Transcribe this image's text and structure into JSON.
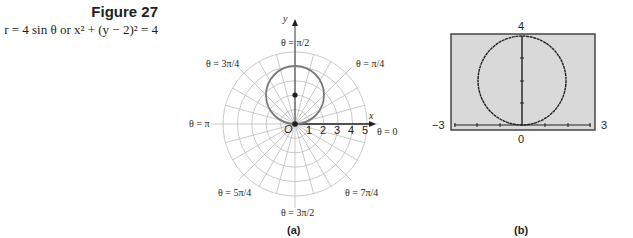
{
  "figure": {
    "title": "Figure 27",
    "equation_polar": "r = 4 sin θ",
    "equation_joiner": "or",
    "equation_rect": "x² + (y − 2)² = 4"
  },
  "panel_a": {
    "sublabel": "(a)",
    "axis_x_label": "x",
    "axis_y_label": "y",
    "pole_label": "O",
    "radial_ticks": [
      "1",
      "2",
      "3",
      "4",
      "5"
    ],
    "angle_labels": {
      "theta_0": "θ = 0",
      "theta_pi_4": "θ = π/4",
      "theta_pi_2": "θ = π/2",
      "theta_3pi_4": "θ = 3π/4",
      "theta_pi": "θ = π",
      "theta_5pi_4": "θ = 5π/4",
      "theta_3pi_2": "θ = 3π/2",
      "theta_7pi_4": "θ = 7π/4"
    }
  },
  "panel_b": {
    "sublabel": "(b)",
    "x_min_label": "−3",
    "x_max_label": "3",
    "y_max_label": "4",
    "y_min_label": "0",
    "screen_bg": "#d9d9d9"
  },
  "chart_data": [
    {
      "type": "scatter",
      "title": "(a) r = 4 sin θ on polar grid",
      "coordinate_system": "polar",
      "grid_circles": [
        1,
        2,
        3,
        4,
        5
      ],
      "ray_spacing_radians": "π/12",
      "series": [
        {
          "name": "r = 4 sin θ",
          "shape": "circle",
          "center": [
            0,
            2
          ],
          "radius": 2
        }
      ],
      "points": [
        {
          "label": "center",
          "x": 0,
          "y": 2
        },
        {
          "label": "O",
          "x": 0,
          "y": 0
        }
      ],
      "xlabel": "x",
      "ylabel": "y",
      "angle_labels": [
        "θ = 0",
        "θ = π/4",
        "θ = π/2",
        "θ = 3π/4",
        "θ = π",
        "θ = 5π/4",
        "θ = 3π/2",
        "θ = 7π/4"
      ],
      "radial_ticks": [
        1,
        2,
        3,
        4,
        5
      ]
    },
    {
      "type": "line",
      "title": "(b) graphing-calculator view of x² + (y − 2)² = 4",
      "xlim": [
        -3,
        3
      ],
      "ylim": [
        0,
        4
      ],
      "series": [
        {
          "name": "x² + (y − 2)² = 4",
          "shape": "circle",
          "center": [
            0,
            2
          ],
          "radius": 2
        }
      ],
      "grid": false
    }
  ]
}
